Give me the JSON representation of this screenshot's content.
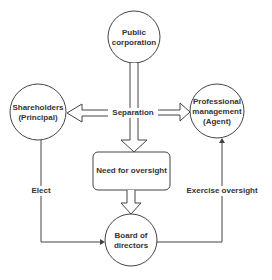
{
  "nodes": {
    "public_corporation": {
      "line1": "Public",
      "line2": "corporation"
    },
    "shareholders": {
      "line1": "Shareholders",
      "line2": "(Principal)"
    },
    "professional_management": {
      "line1": "Professional",
      "line2": "management",
      "line3": "(Agent)"
    },
    "need_for_oversight": {
      "label": "Need for oversight"
    },
    "board_of_directors": {
      "line1": "Board of",
      "line2": "directors"
    }
  },
  "edges": {
    "separation": "Separation",
    "elect": "Elect",
    "exercise_oversight": "Exercise oversight"
  },
  "colors": {
    "stroke": "#444444",
    "text": "#333333",
    "background": "#ffffff"
  }
}
